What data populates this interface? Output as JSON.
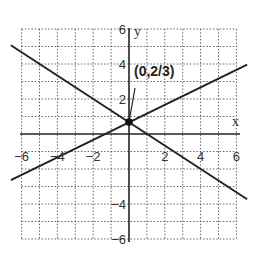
{
  "chart_data": {
    "type": "line",
    "title": "",
    "xlabel": "x",
    "ylabel": "y",
    "xlim": [
      -6,
      6
    ],
    "ylim": [
      -6,
      6
    ],
    "grid": true,
    "x_ticks": [
      -6,
      -4,
      -2,
      2,
      4,
      6
    ],
    "y_ticks": [
      6,
      4,
      2,
      -4,
      -6
    ],
    "x_tick_labels": [
      "-6",
      "-4",
      "-2",
      "2",
      "4",
      "6"
    ],
    "y_tick_labels": [
      "6",
      "4",
      "2",
      "4",
      "6"
    ],
    "series": [
      {
        "name": "y = x/2 + 2/3",
        "x": [
          -6.6,
          6.6
        ],
        "y": [
          -2.63,
          3.97
        ]
      },
      {
        "name": "y = -2x/3 + 2/3",
        "x": [
          -6.6,
          6.6
        ],
        "y": [
          5.07,
          -3.73
        ]
      }
    ],
    "annotations": [
      {
        "text": "(0,2/3)",
        "point": [
          0,
          0.667
        ]
      }
    ]
  },
  "labels": {
    "x_axis": "x",
    "y_axis": "y",
    "annotation": "(0,2/3)"
  }
}
